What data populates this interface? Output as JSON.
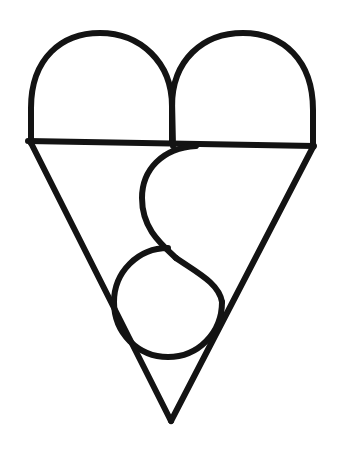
{
  "figure": {
    "domain_kind": "line-drawing",
    "canvas": {
      "width": 338,
      "height": 456,
      "background_color": "#ffffff"
    },
    "style": {
      "stroke_color": "#131313",
      "stroke_width": 6,
      "fill": "none",
      "line_cap": "round",
      "line_join": "round",
      "rendering": "hand-drawn / photocopied, slightly rough edges"
    },
    "strokes": [
      {
        "name": "left-lobe-arc",
        "description": "Left semicircular arch from baseline-left up over the top and down to the center notch",
        "path": "M 31 143 L 31 108 C 31 58 62 33 100 33 C 140 33 172 62 172 106 L 172 143"
      },
      {
        "name": "right-lobe-arc",
        "description": "Right semicircular arch from center notch up over the top and down to baseline-right",
        "path": "M 172 143 L 172 106 C 172 60 203 33 243 33 C 283 33 313 60 313 110 L 313 147"
      },
      {
        "name": "center-notch-stem",
        "description": "Short vertical line at the cusp between the two lobes down to the horizontal baseline",
        "path": "M 172 100 L 173 146"
      },
      {
        "name": "horizontal-baseline",
        "description": "Full-width horizontal line separating the lobes from the triangle",
        "path": "M 28 141 L 314 146"
      },
      {
        "name": "left-triangle-edge",
        "description": "Left diagonal of the inverted triangle running from baseline-left down to the bottom apex",
        "path": "M 31 143 L 171 421"
      },
      {
        "name": "right-triangle-edge",
        "description": "Right diagonal of the inverted triangle running from baseline-right down to the bottom apex",
        "path": "M 313 147 L 171 421"
      },
      {
        "name": "s-curve-upper",
        "description": "Upper lobe of the inner S: from the baseline near center it bows leftward and descends to mid-height",
        "path": "M 196 146 C 162 148 142 170 142 198 C 142 228 160 243 176 258"
      },
      {
        "name": "s-curve-lower",
        "description": "Lower lobe of the inner S: continues right and down, joining the circular loop",
        "path": "M 176 258 C 196 272 219 283 222 302"
      },
      {
        "name": "bottom-circle-loop",
        "description": "Near-complete circle at the bottom of the figure, crossing both triangle edges near the apex",
        "center": [
          168,
          302
        ],
        "radius": 55,
        "path": "M 222 302 C 222 333 198 357 168 357 C 138 357 114 333 114 302 C 114 272 138 248 168 248"
      }
    ],
    "geometry_notes": {
      "lobe_top_y": 33,
      "baseline_y": 143,
      "apex": [
        171,
        421
      ],
      "left_extent_x": 28,
      "right_extent_x": 314,
      "center_x": 172,
      "circle_center": [
        168,
        302
      ],
      "circle_radius": 55
    }
  }
}
